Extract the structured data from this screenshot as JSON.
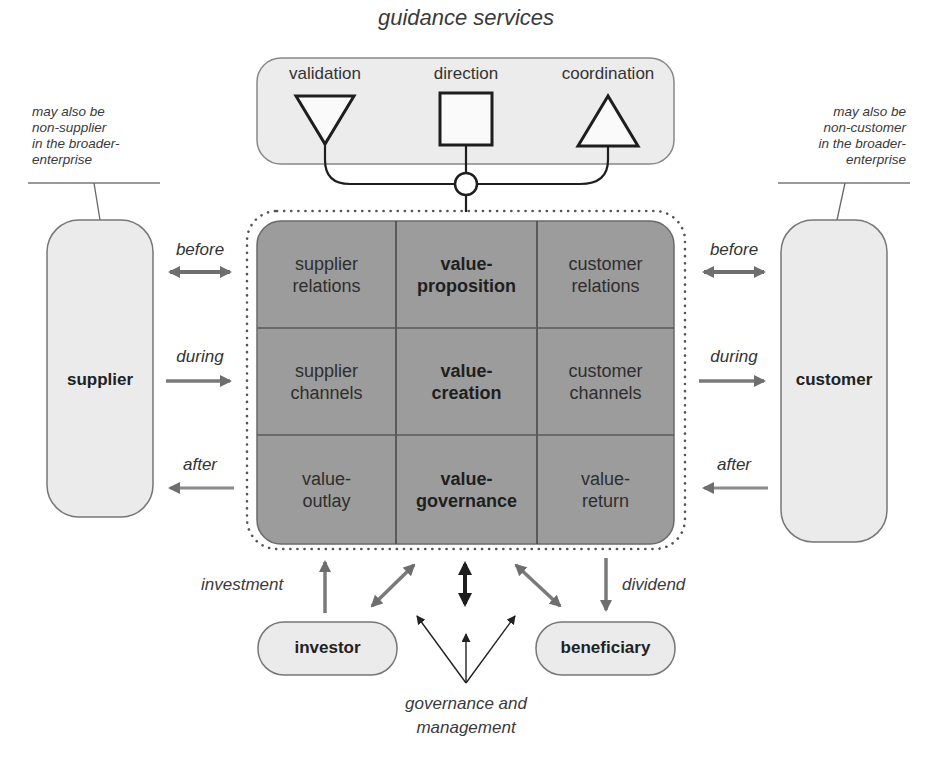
{
  "diagram": {
    "guidance": {
      "title": "guidance services",
      "items": [
        {
          "label": "validation",
          "shape": "down-triangle"
        },
        {
          "label": "direction",
          "shape": "square"
        },
        {
          "label": "coordination",
          "shape": "up-triangle"
        }
      ]
    },
    "notes": {
      "supplier": [
        "may also be",
        "non-supplier",
        "in the broader-",
        "enterprise"
      ],
      "customer": [
        "may also be",
        "non-customer",
        "in the broader-",
        "enterprise"
      ]
    },
    "grid": {
      "cells": [
        [
          "supplier",
          "relations",
          false
        ],
        [
          "value-",
          "proposition",
          true
        ],
        [
          "customer",
          "relations",
          false
        ],
        [
          "supplier",
          "channels",
          false
        ],
        [
          "value-",
          "creation",
          true
        ],
        [
          "customer",
          "channels",
          false
        ],
        [
          "value-",
          "outlay",
          false
        ],
        [
          "value-",
          "governance",
          true
        ],
        [
          "value-",
          "return",
          false
        ]
      ]
    },
    "actors": {
      "supplier": "supplier",
      "customer": "customer",
      "investor": "investor",
      "beneficiary": "beneficiary"
    },
    "flows": {
      "left": {
        "before": "before",
        "during": "during",
        "after": "after"
      },
      "right": {
        "before": "before",
        "during": "during",
        "after": "after"
      },
      "investment": "investment",
      "dividend": "dividend",
      "governance": [
        "governance and",
        "management"
      ]
    },
    "colors": {
      "grid_fill": "#9a9a9a",
      "pill_fill": "#e8e8e8",
      "arrow_gray": "#7a7a7a",
      "arrow_dark": "#1e1e1e",
      "line": "#555555"
    }
  }
}
